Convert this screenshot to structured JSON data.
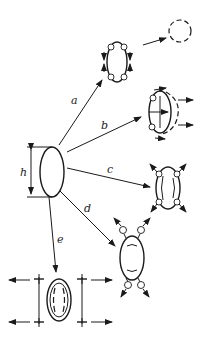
{
  "diagram": {
    "type": "droplet-breakup-modes",
    "source_droplet": {
      "dimension_label": "h"
    },
    "paths": [
      {
        "id": "a",
        "label": "a",
        "result": "rotating ellipse with corner vortices, detaches into dashed circle"
      },
      {
        "id": "b",
        "label": "b",
        "result": "ellipse with swirl and outward horizontal arrows"
      },
      {
        "id": "c",
        "label": "c",
        "result": "double-walled ellipse with four diagonal outward arrows"
      },
      {
        "id": "d",
        "label": "d",
        "result": "ellipse with four satellite droplets ejected"
      },
      {
        "id": "e",
        "label": "e",
        "result": "double-walled ellipse between stretched bars with outward arrows"
      }
    ]
  },
  "colors": {
    "stroke": "#1a1a1a",
    "background": "#ffffff"
  }
}
